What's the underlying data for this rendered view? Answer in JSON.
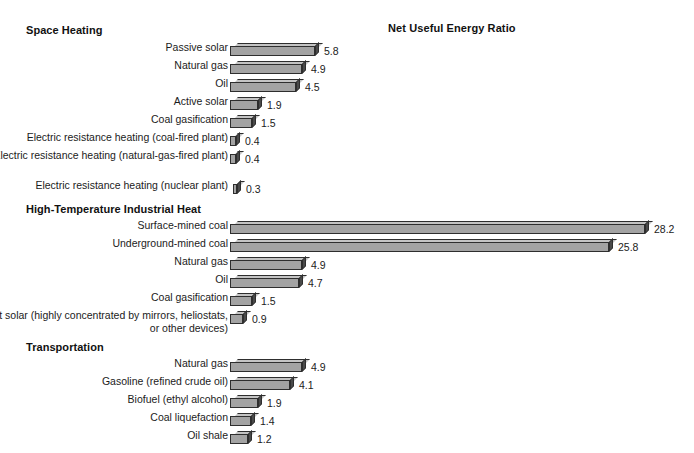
{
  "chart_data": {
    "type": "bar",
    "title": "Net Useful Energy Ratio",
    "xlabel": "",
    "ylabel": "",
    "orientation": "horizontal",
    "grid": false,
    "legend": "none",
    "xlim": [
      0,
      28.2
    ],
    "groups": [
      {
        "name": "Space Heating",
        "categories": [
          "Passive solar",
          "Natural gas",
          "Oil",
          "Active solar",
          "Coal gasification",
          "Electric resistance heating (coal-fired plant)",
          "Electric resistance heating (natural-gas-fired plant)",
          "Electric resistance heating (nuclear plant)"
        ],
        "values": [
          5.8,
          4.9,
          4.5,
          1.9,
          1.5,
          0.4,
          0.4,
          0.3
        ]
      },
      {
        "name": "High-Temperature Industrial Heat",
        "categories": [
          "Surface-mined coal",
          "Underground-mined coal",
          "Natural gas",
          "Oil",
          "Coal gasification",
          "Direct solar (highly concentrated by mirrors, heliostats, or other devices)"
        ],
        "values": [
          28.2,
          25.8,
          4.9,
          4.7,
          1.5,
          0.9
        ]
      },
      {
        "name": "Transportation",
        "categories": [
          "Natural gas",
          "Gasoline (refined crude oil)",
          "Biofuel (ethyl alcohol)",
          "Coal liquefaction",
          "Oil shale"
        ],
        "values": [
          4.9,
          4.1,
          1.9,
          1.4,
          1.2
        ]
      }
    ]
  },
  "colors": {
    "bar_front": "#a3a3a3",
    "bar_top": "#c4c4c4",
    "bar_side": "#4a4a4a",
    "outline": "#2e2e2e",
    "text": "#1b1b1b",
    "background": "#ffffff"
  }
}
